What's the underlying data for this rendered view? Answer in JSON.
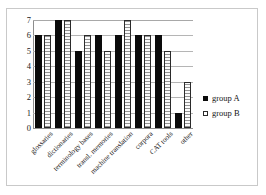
{
  "chart_data": {
    "type": "bar",
    "title": "",
    "subtitle": "",
    "xlabel": "",
    "ylabel": "",
    "ylim": [
      0,
      7
    ],
    "yticks": [
      0,
      1,
      2,
      3,
      4,
      5,
      6,
      7
    ],
    "grid": true,
    "legend_position": "right",
    "categories": [
      "glossaries",
      "dictionaries",
      "terminology bases",
      "transl. memories",
      "machine translation",
      "corpora",
      "CAT tools",
      "other"
    ],
    "series": [
      {
        "name": "group A",
        "color": "#0a0a0a",
        "values": [
          6,
          7,
          5,
          6,
          6,
          6,
          6,
          1
        ]
      },
      {
        "name": "group B",
        "color": "#ffffff",
        "values": [
          6,
          7,
          6,
          5,
          7,
          6,
          5,
          3
        ]
      }
    ]
  },
  "legend": {
    "entries": [
      {
        "label": "group A",
        "marker": "filled-square-marker"
      },
      {
        "label": "group B",
        "marker": "hollow-square-marker"
      }
    ]
  }
}
